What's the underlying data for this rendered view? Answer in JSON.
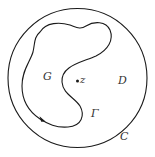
{
  "diagram": {
    "type": "region-diagram",
    "colors": {
      "stroke": "#1a1a1a",
      "text": "#333333",
      "background": "#ffffff"
    },
    "outer_circle": {
      "label": "C",
      "cx": 77.5,
      "cy": 78,
      "r": 69.5
    },
    "curve": {
      "label": "Γ",
      "orientation": "arrow on lower-left arc"
    },
    "region_inside_curve": {
      "label": "G"
    },
    "region_outside_curve": {
      "label": "D"
    },
    "point": {
      "label": "z"
    }
  }
}
